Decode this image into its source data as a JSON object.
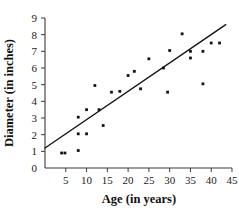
{
  "chart_data": {
    "type": "scatter",
    "title": "",
    "xlabel": "Age (in years)",
    "ylabel": "Diameter (in inches)",
    "xlim": [
      0,
      45
    ],
    "ylim": [
      0,
      9
    ],
    "xticks": [
      0,
      5,
      10,
      15,
      20,
      25,
      30,
      35,
      40,
      45
    ],
    "yticks": [
      0,
      1,
      2,
      3,
      4,
      5,
      6,
      7,
      8,
      9
    ],
    "xtick_labels": [
      "0",
      "5",
      "10",
      "15",
      "20",
      "25",
      "30",
      "35",
      "40",
      "45"
    ],
    "ytick_labels": [
      "0",
      "1",
      "2",
      "3",
      "4",
      "5",
      "6",
      "7",
      "8",
      "9"
    ],
    "grid": false,
    "legend": false,
    "series": [
      {
        "name": "Tree measurements",
        "marker": "square",
        "color": "#141414",
        "points": [
          [
            4.0,
            0.9
          ],
          [
            4.8,
            0.9
          ],
          [
            8.0,
            1.05
          ],
          [
            8.0,
            2.05
          ],
          [
            8.0,
            3.05
          ],
          [
            10.0,
            2.05
          ],
          [
            10.0,
            3.5
          ],
          [
            12.0,
            4.95
          ],
          [
            13.0,
            3.5
          ],
          [
            14.0,
            2.55
          ],
          [
            16.0,
            4.55
          ],
          [
            18.0,
            4.6
          ],
          [
            20.0,
            5.55
          ],
          [
            21.5,
            5.8
          ],
          [
            23.0,
            4.75
          ],
          [
            25.0,
            6.55
          ],
          [
            28.5,
            6.0
          ],
          [
            29.5,
            4.55
          ],
          [
            30.0,
            7.05
          ],
          [
            33.0,
            8.05
          ],
          [
            35.0,
            7.0
          ],
          [
            35.0,
            6.6
          ],
          [
            38.0,
            5.05
          ],
          [
            38.0,
            7.0
          ],
          [
            40.0,
            7.5
          ],
          [
            42.0,
            7.5
          ]
        ]
      }
    ],
    "trend_line": {
      "name": "line of best fit",
      "color": "#141414",
      "x_start": 0.0,
      "y_start": 1.2,
      "x_end": 43.5,
      "y_end": 8.6
    }
  }
}
